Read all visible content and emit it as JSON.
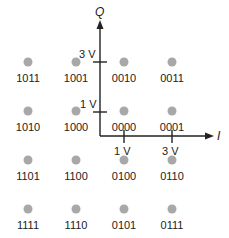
{
  "diagram": {
    "type": "16-QAM constellation",
    "axes": {
      "x_label": "I",
      "y_label": "Q",
      "color": "#222222"
    },
    "ticks": {
      "q": [
        {
          "label": "3 V",
          "value": 3
        },
        {
          "label": "1 V",
          "value": 1
        }
      ],
      "i": [
        {
          "label": "1 V",
          "value": 1
        },
        {
          "label": "3 V",
          "value": 3
        }
      ]
    },
    "point_color": "#a8a8a8",
    "points": [
      {
        "code": "1011",
        "i": -3,
        "q": 3
      },
      {
        "code": "1001",
        "i": -1,
        "q": 3
      },
      {
        "code": "0010",
        "i": 1,
        "q": 3
      },
      {
        "code": "0011",
        "i": 3,
        "q": 3
      },
      {
        "code": "1010",
        "i": -3,
        "q": 1
      },
      {
        "code": "1000",
        "i": -1,
        "q": 1
      },
      {
        "code": "0000",
        "i": 1,
        "q": 1
      },
      {
        "code": "0001",
        "i": 3,
        "q": 1
      },
      {
        "code": "1101",
        "i": -3,
        "q": -1
      },
      {
        "code": "1100",
        "i": -1,
        "q": -1
      },
      {
        "code": "0100",
        "i": 1,
        "q": -1
      },
      {
        "code": "0110",
        "i": 3,
        "q": -1
      },
      {
        "code": "1111",
        "i": -3,
        "q": -3
      },
      {
        "code": "1110",
        "i": -1,
        "q": -3
      },
      {
        "code": "0101",
        "i": 1,
        "q": -3
      },
      {
        "code": "0111",
        "i": 3,
        "q": -3
      }
    ]
  }
}
